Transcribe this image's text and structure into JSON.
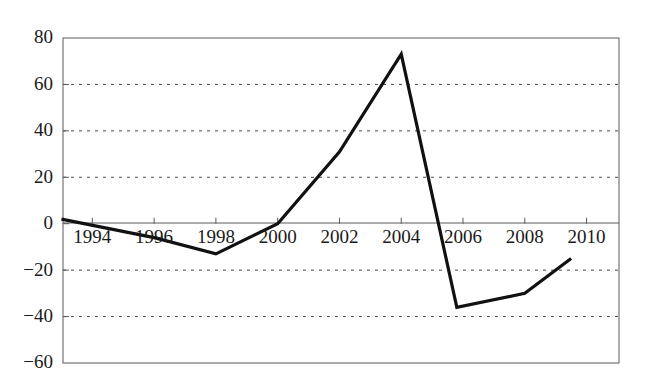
{
  "chart_data": {
    "type": "line",
    "title": "",
    "subtitle": "",
    "xlabel": "",
    "ylabel": "",
    "x": [
      1993,
      1996,
      1998,
      2000,
      2002,
      2004,
      2005.8,
      2008,
      2009.5
    ],
    "values": [
      2,
      -6,
      -13,
      0,
      31,
      73,
      -36,
      -30,
      -15
    ],
    "series": [
      {
        "name": "",
        "x": [
          1993,
          1996,
          1998,
          2000,
          2002,
          2004,
          2005.8,
          2008,
          2009.5
        ],
        "values": [
          2,
          -6,
          -13,
          0,
          31,
          73,
          -36,
          -30,
          -15
        ],
        "color": "#111111"
      }
    ],
    "x_tick_labels": [
      "1994",
      "1996",
      "1998",
      "2000",
      "2002",
      "2004",
      "2006",
      "2008",
      "2010"
    ],
    "x_tick_values": [
      1994,
      1996,
      1998,
      2000,
      2002,
      2004,
      2006,
      2008,
      2010
    ],
    "y_tick_labels": [
      "80",
      "60",
      "40",
      "20",
      "0",
      "−20",
      "−40",
      "−60"
    ],
    "y_tick_values": [
      80,
      60,
      40,
      20,
      0,
      -20,
      -40,
      -60
    ],
    "xlim": [
      1993.05,
      2011.05
    ],
    "ylim": [
      -60,
      80
    ],
    "grid": true,
    "grid_values": [
      60,
      40,
      20,
      -20,
      -40
    ],
    "zero_line": 0,
    "legend": null,
    "legend_position": "none",
    "annotations": [],
    "line_color": "#111111",
    "grid_color": "#4a4a4a",
    "axis_color": "#5a5a5a",
    "background_color": "#ffffff",
    "x_tick_label_position": "inside-below-zero-line"
  }
}
